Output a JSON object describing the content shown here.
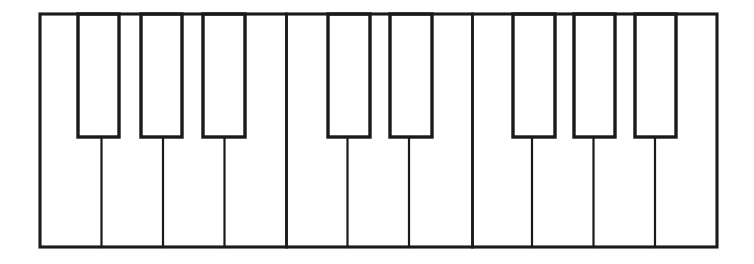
{
  "figure": {
    "canvas": {
      "width": 754,
      "height": 264
    },
    "ink_color": "#1a1a1a",
    "key_fill_color": "#ffffff",
    "background_color": "#ffffff"
  },
  "keybed": {
    "label": "keybed outline",
    "x": 40,
    "y": 14,
    "width": 677,
    "height": 233,
    "stroke_width": 3.1
  },
  "geometry": {
    "white_key_count": 11,
    "black_key_count": 8,
    "white_key_width": 61.5,
    "white_key_top": 14,
    "white_key_bottom": 247,
    "black_key_top": 14,
    "black_key_bottom": 137,
    "black_key_width": 41
  },
  "white_keys": [
    {
      "index": 0,
      "note": "C",
      "x": 40.0,
      "width": 61.5
    },
    {
      "index": 1,
      "note": "D",
      "x": 101.5,
      "width": 61.5
    },
    {
      "index": 2,
      "note": "E",
      "x": 163.0,
      "width": 61.5
    },
    {
      "index": 3,
      "note": "F",
      "x": 224.5,
      "width": 61.5
    },
    {
      "index": 4,
      "note": "G",
      "x": 286.0,
      "width": 61.5
    },
    {
      "index": 5,
      "note": "A",
      "x": 347.5,
      "width": 61.5
    },
    {
      "index": 6,
      "note": "B",
      "x": 409.0,
      "width": 61.5
    },
    {
      "index": 7,
      "note": "C",
      "x": 470.5,
      "width": 61.5
    },
    {
      "index": 8,
      "note": "D",
      "x": 532.0,
      "width": 61.5
    },
    {
      "index": 9,
      "note": "E",
      "x": 593.5,
      "width": 61.5
    },
    {
      "index": 10,
      "note": "F",
      "x": 655.0,
      "width": 62.0
    }
  ],
  "white_key_dividers": [
    {
      "index": 0,
      "x": 101.5,
      "kind": "lower",
      "y_start": 137,
      "y_end": 247
    },
    {
      "index": 1,
      "x": 163.0,
      "kind": "lower",
      "y_start": 137,
      "y_end": 247
    },
    {
      "index": 2,
      "x": 224.5,
      "kind": "lower",
      "y_start": 137,
      "y_end": 247
    },
    {
      "index": 3,
      "x": 286.5,
      "kind": "full",
      "y_start": 14,
      "y_end": 247
    },
    {
      "index": 4,
      "x": 347.5,
      "kind": "lower",
      "y_start": 137,
      "y_end": 247
    },
    {
      "index": 5,
      "x": 409.0,
      "kind": "lower",
      "y_start": 137,
      "y_end": 247
    },
    {
      "index": 6,
      "x": 472.5,
      "kind": "full",
      "y_start": 14,
      "y_end": 247
    },
    {
      "index": 7,
      "x": 532.0,
      "kind": "lower",
      "y_start": 137,
      "y_end": 247
    },
    {
      "index": 8,
      "x": 593.5,
      "kind": "lower",
      "y_start": 137,
      "y_end": 247
    },
    {
      "index": 9,
      "x": 655.0,
      "kind": "lower",
      "y_start": 137,
      "y_end": 247
    }
  ],
  "black_keys": [
    {
      "index": 0,
      "note": "C#",
      "group": 1,
      "x": 78,
      "y": 14,
      "width": 41,
      "height": 123
    },
    {
      "index": 1,
      "note": "D#",
      "group": 1,
      "x": 141,
      "y": 14,
      "width": 41,
      "height": 123
    },
    {
      "index": 2,
      "note": "F#",
      "group": 1,
      "x": 203,
      "y": 14,
      "width": 42,
      "height": 123
    },
    {
      "index": 3,
      "note": "G#",
      "group": 2,
      "x": 328,
      "y": 14,
      "width": 42,
      "height": 123
    },
    {
      "index": 4,
      "note": "A#",
      "group": 2,
      "x": 390,
      "y": 14,
      "width": 42,
      "height": 123
    },
    {
      "index": 5,
      "note": "C#",
      "group": 3,
      "x": 513,
      "y": 14,
      "width": 42,
      "height": 123
    },
    {
      "index": 6,
      "note": "D#",
      "group": 3,
      "x": 574,
      "y": 14,
      "width": 41,
      "height": 123
    },
    {
      "index": 7,
      "note": "F#",
      "group": 3,
      "x": 635,
      "y": 14,
      "width": 41,
      "height": 123
    }
  ]
}
